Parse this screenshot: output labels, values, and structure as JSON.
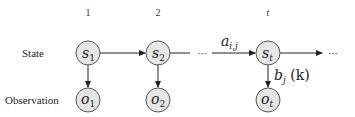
{
  "row_labels": {
    "state": "State",
    "observation": "Observation"
  },
  "time_indices": [
    "1",
    "2",
    "t"
  ],
  "states": [
    {
      "sym": "s",
      "sub": "1"
    },
    {
      "sym": "s",
      "sub": "2"
    },
    {
      "sym": "s",
      "sub": "t"
    }
  ],
  "observations": [
    {
      "sym": "o",
      "sub": "1"
    },
    {
      "sym": "o",
      "sub": "2"
    },
    {
      "sym": "o",
      "sub": "t"
    }
  ],
  "ellipsis": "···",
  "transition_label": {
    "sym": "a",
    "sub": "i,j"
  },
  "emission_label": {
    "sym": "b",
    "sub": "j",
    "arg": " (k)"
  }
}
